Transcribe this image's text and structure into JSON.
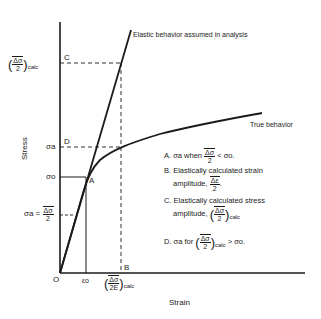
{
  "figure": {
    "axes": {
      "x_label": "Strain",
      "y_label": "Stress",
      "origin_label": "O"
    },
    "curves": {
      "elastic_label": "Elastic behavior assumed in analysis",
      "true_label": "True behavior"
    },
    "y_ticks": {
      "calc_stress": "calc",
      "calc_stress_num": "Δσ",
      "calc_stress_den": "2",
      "sigma_a_upper": "σa",
      "sigma_o": "σo",
      "sigma_a_lower_prefix": "σa =",
      "sigma_a_lower_num": "Δσ",
      "sigma_a_lower_den": "2"
    },
    "x_ticks": {
      "epsilon_o": "εo",
      "calc_strain_num": "Δσ",
      "calc_strain_den": "2E",
      "calc_strain_sub": "calc"
    },
    "points": {
      "A": "A",
      "B": "B",
      "C": "C",
      "D": "D"
    },
    "legend": [
      {
        "key": "A.",
        "text_pre": "σa when",
        "num": "Δσ",
        "den": "2",
        "text_post": "< σo."
      },
      {
        "key": "B.",
        "line1": "Elastically calculated strain",
        "line2_pre": "amplitude,",
        "num": "Δε",
        "den": "2",
        "line2_post": "."
      },
      {
        "key": "C.",
        "line1": "Elastically calculated stress",
        "line2_pre": "amplitude,",
        "num": "Δσ",
        "den": "2",
        "sub": "calc"
      },
      {
        "key": "D.",
        "text_pre": "σa for",
        "num": "Δσ",
        "den": "2",
        "sub": "calc",
        "text_post": "> σo."
      }
    ],
    "colors": {
      "ink": "#1a1a1a",
      "background": "#ffffff"
    }
  }
}
